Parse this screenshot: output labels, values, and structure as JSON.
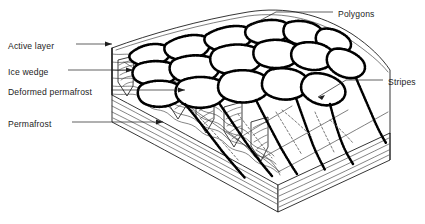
{
  "figure": {
    "name": "periglacial-block-diagram",
    "background_color": "#ffffff",
    "line_color": "#111111"
  },
  "labels": {
    "left": [
      {
        "id": "active-layer",
        "text": "Active layer",
        "x": 8,
        "y": 46
      },
      {
        "id": "ice-wedge",
        "text": "Ice wedge",
        "x": 8,
        "y": 72
      },
      {
        "id": "deformed-permafrost",
        "text": "Deformed permafrost",
        "x": 8,
        "y": 92
      },
      {
        "id": "permafrost",
        "text": "Permafrost",
        "x": 8,
        "y": 124
      }
    ],
    "right": [
      {
        "id": "polygons",
        "text": "Polygons",
        "x": 338,
        "y": 14
      },
      {
        "id": "stripes",
        "text": "Stripes",
        "x": 388,
        "y": 82
      }
    ]
  },
  "features": {
    "polygons_label": "Polygons",
    "stripes_label": "Stripes",
    "active_layer_label": "Active layer",
    "ice_wedge_label": "Ice wedge",
    "deformed_permafrost_label": "Deformed permafrost",
    "permafrost_label": "Permafrost"
  }
}
